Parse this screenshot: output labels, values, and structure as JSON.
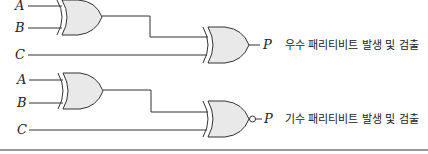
{
  "diagram": {
    "circuits": [
      {
        "id": "even",
        "inputs": [
          {
            "label": "A"
          },
          {
            "label": "B"
          },
          {
            "label": "C"
          }
        ],
        "gates": [
          "XOR",
          "XOR"
        ],
        "output": {
          "label": "P",
          "description": "우수 패리티비트 발생 및 검출"
        }
      },
      {
        "id": "odd",
        "inputs": [
          {
            "label": "A"
          },
          {
            "label": "B"
          },
          {
            "label": "C"
          }
        ],
        "gates": [
          "XOR",
          "XNOR"
        ],
        "output": {
          "label": "P",
          "description": "기수 패리티비트 발생 및 검출"
        }
      }
    ]
  },
  "colors": {
    "gate_fill": "#e9e9e9",
    "line": "#333333",
    "divider": "#9a9a9a"
  }
}
